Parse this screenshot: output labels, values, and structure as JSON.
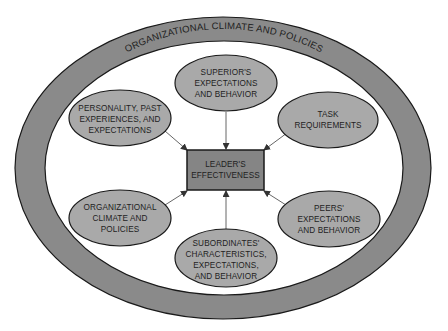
{
  "diagram": {
    "type": "influence-diagram",
    "colors": {
      "ring_fill": "#8a8a8a",
      "ellipse_fill": "#a9a9a9",
      "box_fill": "#858585",
      "stroke": "#1a1a1a",
      "arrow": "#555555",
      "background": "#ffffff"
    },
    "outer_ring": {
      "label": "ORGANIZATIONAL CLIMATE AND POLICIES"
    },
    "center": {
      "lines": [
        "LEADER'S",
        "EFFECTIVENESS"
      ]
    },
    "factors": [
      {
        "id": "superior",
        "lines": [
          "SUPERIOR'S",
          "EXPECTATIONS",
          "AND BEHAVIOR"
        ]
      },
      {
        "id": "personality",
        "lines": [
          "PERSONALITY, PAST",
          "EXPERIENCES, AND",
          "EXPECTATIONS"
        ]
      },
      {
        "id": "task",
        "lines": [
          "TASK",
          "REQUIREMENTS"
        ]
      },
      {
        "id": "org-climate",
        "lines": [
          "ORGANIZATIONAL",
          "CLIMATE AND",
          "POLICIES"
        ]
      },
      {
        "id": "peers",
        "lines": [
          "PEERS'",
          "EXPECTATIONS",
          "AND BEHAVIOR"
        ]
      },
      {
        "id": "subordinates",
        "lines": [
          "SUBORDINATES'",
          "CHARACTERISTICS,",
          "EXPECTATIONS,",
          "AND BEHAVIOR"
        ]
      }
    ]
  }
}
